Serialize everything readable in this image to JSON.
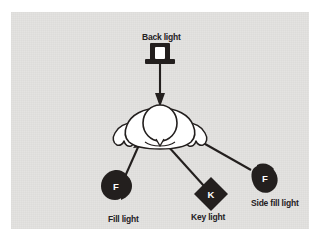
{
  "figure": {
    "panel_bg": "#e4e3e1",
    "ink": "#231f1e",
    "paper": "#ffffff"
  },
  "subject": {
    "name": "head-from-above",
    "description": "Top-down view of a person's head and shoulders"
  },
  "lights": [
    {
      "id": "back",
      "label": "Back light",
      "glyph": "B",
      "shape": "rectangle-on-stand",
      "label_x": 131,
      "label_y": 21,
      "beam": "downward arrow to subject"
    },
    {
      "id": "fill",
      "label": "Fill light",
      "glyph": "F",
      "shape": "teardrop-right",
      "label_x": 97,
      "label_y": 203,
      "beam": "up-right arrow to subject"
    },
    {
      "id": "key",
      "label": "Key light",
      "glyph": "K",
      "shape": "diamond",
      "label_x": 180,
      "label_y": 201,
      "beam": "upward-left arrow to subject"
    },
    {
      "id": "side-fill",
      "label": "Side fill light",
      "glyph": "F",
      "shape": "teardrop-up-left",
      "label_x": 240,
      "label_y": 187,
      "beam": "up-left arrow to subject"
    }
  ]
}
